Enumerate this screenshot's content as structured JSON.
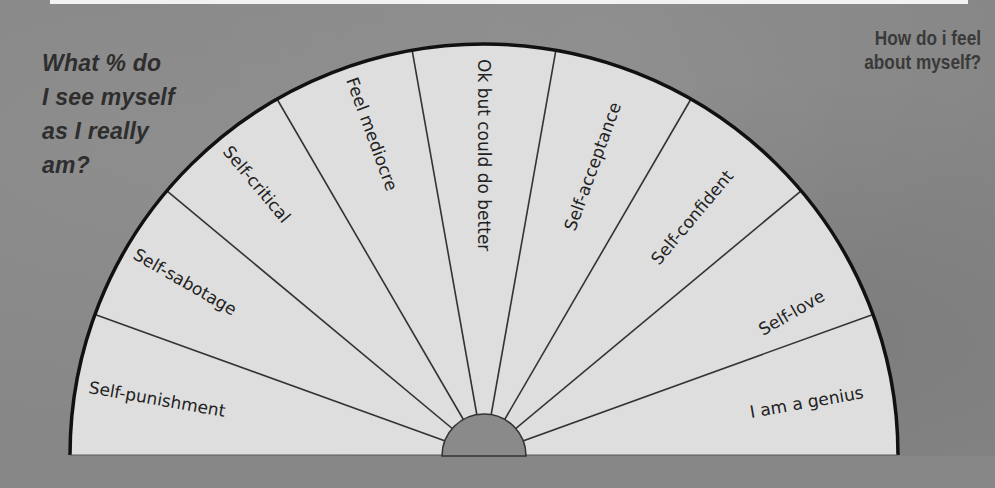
{
  "top_bar": {
    "color": "#f2f2f2"
  },
  "left_question": {
    "lines": [
      "What % do",
      "I see myself",
      "as I really",
      "am?"
    ]
  },
  "right_question": {
    "lines": [
      "How do i feel",
      "about myself?"
    ]
  },
  "wheel": {
    "fill_color": "#dedede",
    "outline_color": "#111111",
    "divider_color": "#333333",
    "center_color": "#8a8a8a",
    "segments": [
      {
        "label": "Self-punishment"
      },
      {
        "label": "Self-sabotage"
      },
      {
        "label": "Self-critical"
      },
      {
        "label": "Feel mediocre"
      },
      {
        "label": "Ok but could do better"
      },
      {
        "label": "Self-acceptance"
      },
      {
        "label": "Self-confident"
      },
      {
        "label": "Self-love"
      },
      {
        "label": "I am a genius"
      }
    ]
  }
}
